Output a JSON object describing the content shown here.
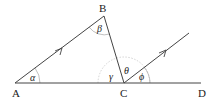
{
  "diagram": {
    "type": "geometry",
    "points": {
      "A": {
        "label": "A",
        "x": 15,
        "y": 83
      },
      "B": {
        "label": "B",
        "x": 104,
        "y": 16
      },
      "C": {
        "label": "C",
        "x": 124,
        "y": 83
      },
      "D": {
        "label": "D",
        "x": 201,
        "y": 83
      },
      "E": {
        "x": 189,
        "y": 33
      }
    },
    "angles": {
      "alpha": {
        "label": "α",
        "at": "A"
      },
      "beta": {
        "label": "β",
        "at": "B"
      },
      "gamma": {
        "label": "γ",
        "at": "C"
      },
      "theta": {
        "label": "θ",
        "at": "C"
      },
      "phi": {
        "label": "ϕ",
        "at": "C"
      }
    },
    "colors": {
      "line": "#444444",
      "arc": "#aaaaaa",
      "text": "#222222"
    }
  }
}
